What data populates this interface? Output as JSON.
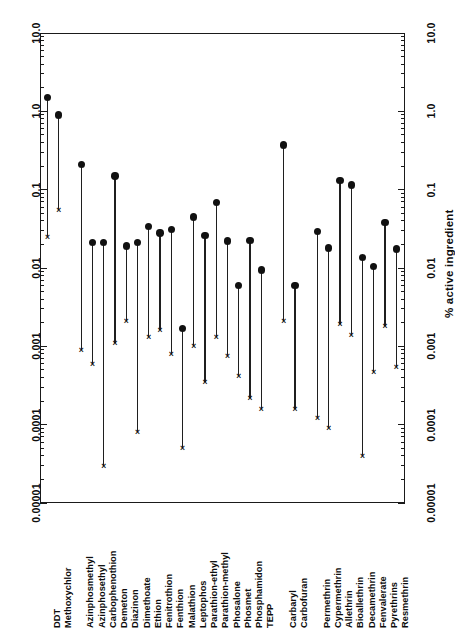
{
  "chart_data": {
    "type": "scatter",
    "title": "",
    "xlabel": "",
    "ylabel": "% active ingredient",
    "yscale": "log",
    "ylim": [
      1e-05,
      10.0
    ],
    "ytick_labels": [
      "10.0",
      "1.0",
      "0.1",
      "0.01",
      "0.001",
      "0.0001",
      "0.00001"
    ],
    "ytick_values": [
      10.0,
      1.0,
      0.1,
      0.01,
      0.001,
      0.0001,
      1e-05
    ],
    "right_axis_tick_labels": [
      "10.0",
      "1.0",
      "0.1",
      "0.01",
      "0.001",
      "0.0001",
      "0.00001"
    ],
    "grid": false,
    "legend": "none",
    "marker_high": "filled-circle",
    "marker_low": "x-cross",
    "series": [
      {
        "name": "high (filled circle)",
        "marker": "circle"
      },
      {
        "name": "low (x mark)",
        "marker": "x"
      }
    ],
    "groups": [
      {
        "name": "Organochlorines",
        "categories": [
          "DDT",
          "Methoxychlor"
        ]
      },
      {
        "name": "Organophosphates",
        "categories": [
          "Azinphosmethyl",
          "Azinphosethyl",
          "Carbophenothion",
          "Demeton",
          "Diazinon",
          "Dimethoate",
          "Ethion",
          "Fenitrothion",
          "Fenthion",
          "Malathion",
          "Leptophos",
          "Parathion-ethyl",
          "Parathion-methyl",
          "Phosalone",
          "Phosmet",
          "Phosphamidon",
          "TEPP"
        ]
      },
      {
        "name": "Carbamates",
        "categories": [
          "Carbaryl",
          "Carbofuran"
        ]
      },
      {
        "name": "Pyrethroids",
        "categories": [
          "Permethrin",
          "Cypermethrin",
          "Allethrin",
          "Bioallethrin",
          "Decamethrin",
          "Fenvalerate",
          "Pyrethrins",
          "Resmethrin"
        ]
      }
    ],
    "categories": [
      "DDT",
      "Methoxychlor",
      "Azinphosmethyl",
      "Azinphosethyl",
      "Carbophenothion",
      "Demeton",
      "Diazinon",
      "Dimethoate",
      "Ethion",
      "Fenitrothion",
      "Fenthion",
      "Malathion",
      "Leptophos",
      "Parathion-ethyl",
      "Parathion-methyl",
      "Phosalone",
      "Phosmet",
      "Phosphamidon",
      "TEPP",
      "Carbaryl",
      "Carbofuran",
      "Permethrin",
      "Cypermethrin",
      "Allethrin",
      "Bioallethrin",
      "Decamethrin",
      "Fenvalerate",
      "Pyrethrins",
      "Resmethrin"
    ],
    "points": [
      {
        "label": "DDT",
        "slot": 0,
        "high": 1.5,
        "low": 0.025
      },
      {
        "label": "Methoxychlor",
        "slot": 1,
        "high": 0.9,
        "low": 0.055
      },
      {
        "label": "Azinphosmethyl",
        "slot": 3,
        "high": 0.21,
        "low": 0.0009
      },
      {
        "label": "Azinphosethyl",
        "slot": 4,
        "high": 0.021,
        "low": 0.0006
      },
      {
        "label": "Carbophenothion",
        "slot": 5,
        "high": 0.021,
        "low": 3e-05
      },
      {
        "label": "Demeton",
        "slot": 6,
        "high": 0.15,
        "low": 0.0011
      },
      {
        "label": "Diazinon",
        "slot": 7,
        "high": 0.019,
        "low": 0.0021
      },
      {
        "label": "Dimethoate",
        "slot": 8,
        "high": 0.021,
        "low": 8e-05
      },
      {
        "label": "Ethion",
        "slot": 9,
        "high": 0.034,
        "low": 0.0013
      },
      {
        "label": "Fenitrothion",
        "slot": 10,
        "high": 0.028,
        "low": 0.0016
      },
      {
        "label": "Fenthion",
        "slot": 11,
        "high": 0.031,
        "low": 0.0008
      },
      {
        "label": "Malathion",
        "slot": 12,
        "high": 0.0017,
        "low": 5e-05
      },
      {
        "label": "Leptophos",
        "slot": 13,
        "high": 0.045,
        "low": 0.001
      },
      {
        "label": "Parathion-ethyl",
        "slot": 14,
        "high": 0.026,
        "low": 0.00035
      },
      {
        "label": "Parathion-methyl",
        "slot": 15,
        "high": 0.069,
        "low": 0.0013
      },
      {
        "label": "Phosalone",
        "slot": 16,
        "high": 0.022,
        "low": 0.00075
      },
      {
        "label": "Phosmet",
        "slot": 17,
        "high": 0.006,
        "low": 0.00042
      },
      {
        "label": "Phosphamidon",
        "slot": 18,
        "high": 0.0225,
        "low": 0.00022
      },
      {
        "label": "TEPP",
        "slot": 19,
        "high": 0.0094,
        "low": 0.00016
      },
      {
        "label": "Carbaryl",
        "slot": 21,
        "high": 0.37,
        "low": 0.0021
      },
      {
        "label": "Carbofuran",
        "slot": 22,
        "high": 0.006,
        "low": 0.00016
      },
      {
        "label": "Permethrin",
        "slot": 24,
        "high": 0.029,
        "low": 0.00012
      },
      {
        "label": "Cypermethrin",
        "slot": 25,
        "high": 0.018,
        "low": 9e-05
      },
      {
        "label": "Allethrin",
        "slot": 26,
        "high": 0.13,
        "low": 0.0019
      },
      {
        "label": "Bioallethrin",
        "slot": 27,
        "high": 0.115,
        "low": 0.0014
      },
      {
        "label": "Decamethrin",
        "slot": 28,
        "high": 0.0135,
        "low": 4e-05
      },
      {
        "label": "Fenvalerate",
        "slot": 29,
        "high": 0.0105,
        "low": 0.00047
      },
      {
        "label": "Pyrethrins",
        "slot": 30,
        "high": 0.038,
        "low": 0.0018
      },
      {
        "label": "Resmethrin",
        "slot": 31,
        "high": 0.0175,
        "low": 0.00055
      }
    ]
  },
  "axis": {
    "title_right": "% active ingredient"
  }
}
